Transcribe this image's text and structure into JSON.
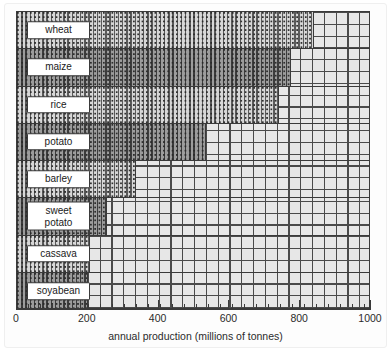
{
  "chart_data": {
    "type": "bar",
    "orientation": "horizontal",
    "title": "",
    "xlabel": "annual production (millions of tonnes)",
    "ylabel": "",
    "xlim": [
      0,
      1000
    ],
    "xticks": [
      0,
      200,
      400,
      600,
      800,
      1000
    ],
    "xtick_labels": [
      "0",
      "200",
      "400",
      "600",
      "800",
      "1000"
    ],
    "grid": true,
    "legend": false,
    "categories": [
      "wheat",
      "maize",
      "rice",
      "potato",
      "barley",
      "sweet potato",
      "cassava",
      "soyabean"
    ],
    "values": [
      840,
      775,
      740,
      535,
      335,
      255,
      205,
      200
    ],
    "bars": [
      {
        "label": "wheat",
        "value": 840,
        "shade": "light"
      },
      {
        "label": "maize",
        "value": 775,
        "shade": "dark"
      },
      {
        "label": "rice",
        "value": 740,
        "shade": "light"
      },
      {
        "label": "potato",
        "value": 535,
        "shade": "dark"
      },
      {
        "label": "barley",
        "value": 335,
        "shade": "light"
      },
      {
        "label": "sweet\npotato",
        "value": 255,
        "shade": "dark"
      },
      {
        "label": "cassava",
        "value": 205,
        "shade": "light"
      },
      {
        "label": "soyabean",
        "value": 200,
        "shade": "dark"
      }
    ]
  },
  "colors": {
    "light_bar": "#d7d7d7",
    "dark_bar": "#9c9c9c",
    "grid_background": "#e7e7e7",
    "grid_line": "#4a4a4a",
    "outline": "#3a3a3a",
    "label_background": "#ffffff",
    "text": "#2b2b2b",
    "page_background": "#ffffff"
  }
}
